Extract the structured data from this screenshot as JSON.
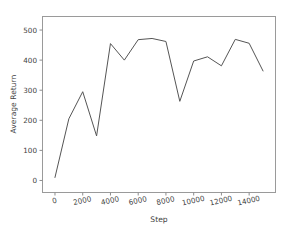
{
  "figure": {
    "background_color": "#ffffff",
    "width": 289,
    "height": 231
  },
  "chart_data": {
    "type": "line",
    "title": "",
    "xlabel": "Step",
    "ylabel": "Average Return",
    "xlim": [
      -900,
      15900
    ],
    "ylim": [
      -40,
      545
    ],
    "xticks": [
      0,
      2000,
      4000,
      6000,
      8000,
      10000,
      12000,
      14000
    ],
    "xtick_labels": [
      "0",
      "2000",
      "4000",
      "6000",
      "8000",
      "10000",
      "12000",
      "14000"
    ],
    "yticks": [
      0,
      100,
      200,
      300,
      400,
      500
    ],
    "ytick_labels": [
      "0",
      "100",
      "200",
      "300",
      "400",
      "500"
    ],
    "grid": false,
    "legend": null,
    "line_color": "#555555",
    "line_width": 1.0,
    "x": [
      0,
      1000,
      2000,
      3000,
      4000,
      5000,
      6000,
      7000,
      8000,
      9000,
      10000,
      11000,
      12000,
      13000,
      14000,
      15000
    ],
    "values": [
      10,
      205,
      295,
      148,
      455,
      400,
      468,
      472,
      462,
      263,
      397,
      411,
      381,
      469,
      456,
      364
    ],
    "series": [
      {
        "name": "Average Return",
        "values": [
          10,
          205,
          295,
          148,
          455,
          400,
          468,
          472,
          462,
          263,
          397,
          411,
          381,
          469,
          456,
          364
        ]
      }
    ]
  },
  "axes": {
    "spine_color": "#9a9a9a",
    "tick_color": "#8d8d8d",
    "label_color": "#3f3f3f"
  }
}
